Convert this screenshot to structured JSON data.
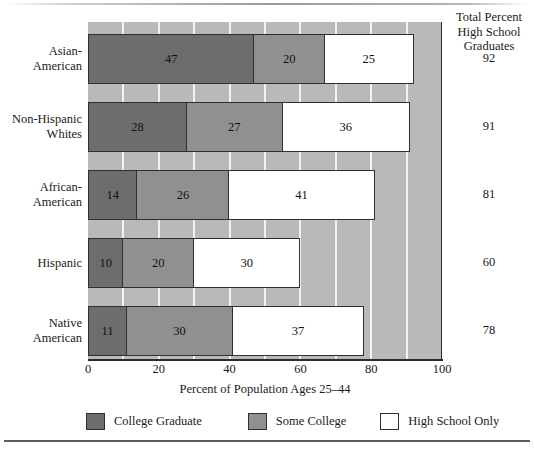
{
  "chart_data": {
    "type": "bar",
    "orientation": "horizontal",
    "stacked": true,
    "title": "",
    "xlabel": "Percent of Population Ages 25–44",
    "ylabel": "",
    "xlim": [
      0,
      100
    ],
    "xticks": [
      "0",
      "20",
      "40",
      "60",
      "80",
      "100"
    ],
    "xtick_values": [
      0,
      20,
      40,
      60,
      80,
      100
    ],
    "grid": "vertical gridlines every 10 units, white on gray panel",
    "legend_position": "below axis, horizontal",
    "categories": [
      "Asian-American",
      "Non-Hispanic Whites",
      "African-American",
      "Hispanic",
      "Native American"
    ],
    "series": [
      {
        "name": "College Graduate",
        "color": "#6d6d6d",
        "values": [
          47,
          28,
          14,
          10,
          11
        ]
      },
      {
        "name": "Some College",
        "color": "#909090",
        "values": [
          20,
          27,
          26,
          20,
          30
        ]
      },
      {
        "name": "High School Only",
        "color": "#ffffff",
        "values": [
          25,
          36,
          41,
          30,
          37
        ]
      }
    ],
    "annotations": {
      "right_column_header": "Total Percent High School Graduates",
      "right_column_values": [
        92,
        91,
        81,
        60,
        78
      ]
    }
  },
  "right_column": {
    "header_line1": "Total Percent",
    "header_line2": "High School",
    "header_line3": "Graduates",
    "values": [
      "92",
      "91",
      "81",
      "60",
      "78"
    ]
  },
  "categories": [
    {
      "line1": "Asian-",
      "line2": "American"
    },
    {
      "line1": "Non-Hispanic",
      "line2": "Whites"
    },
    {
      "line1": "African-",
      "line2": "American"
    },
    {
      "line1": "Hispanic",
      "line2": ""
    },
    {
      "line1": "Native",
      "line2": "American"
    }
  ],
  "bars": [
    {
      "segments": [
        {
          "label": "47",
          "value": 47,
          "series": "College Graduate"
        },
        {
          "label": "20",
          "value": 20,
          "series": "Some College"
        },
        {
          "label": "25",
          "value": 25,
          "series": "High School Only"
        }
      ]
    },
    {
      "segments": [
        {
          "label": "28",
          "value": 28,
          "series": "College Graduate"
        },
        {
          "label": "27",
          "value": 27,
          "series": "Some College"
        },
        {
          "label": "36",
          "value": 36,
          "series": "High School Only"
        }
      ]
    },
    {
      "segments": [
        {
          "label": "14",
          "value": 14,
          "series": "College Graduate"
        },
        {
          "label": "26",
          "value": 26,
          "series": "Some College"
        },
        {
          "label": "41",
          "value": 41,
          "series": "High School Only"
        }
      ]
    },
    {
      "segments": [
        {
          "label": "10",
          "value": 10,
          "series": "College Graduate"
        },
        {
          "label": "20",
          "value": 20,
          "series": "Some College"
        },
        {
          "label": "30",
          "value": 30,
          "series": "High School Only"
        }
      ]
    },
    {
      "segments": [
        {
          "label": "11",
          "value": 11,
          "series": "College Graduate"
        },
        {
          "label": "30",
          "value": 30,
          "series": "Some College"
        },
        {
          "label": "37",
          "value": 37,
          "series": "High School Only"
        }
      ]
    }
  ],
  "axis": {
    "title": "Percent of Population Ages 25–44",
    "ticks": [
      "0",
      "20",
      "40",
      "60",
      "80",
      "100"
    ]
  },
  "legend": {
    "items": [
      {
        "label": "College Graduate",
        "color": "#6d6d6d"
      },
      {
        "label": "Some College",
        "color": "#909090"
      },
      {
        "label": "High School Only",
        "color": "#ffffff"
      }
    ]
  }
}
